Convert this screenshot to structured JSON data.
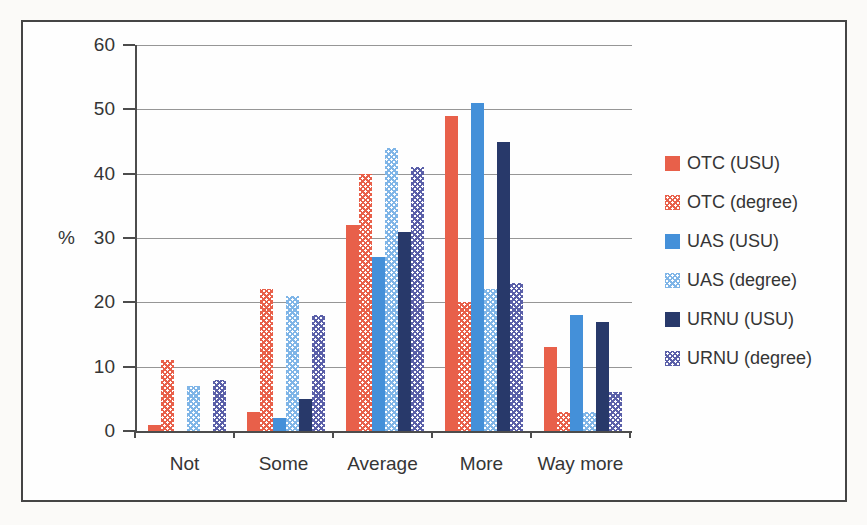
{
  "chart_data": {
    "type": "bar",
    "title": "",
    "categories": [
      "Not",
      "Some",
      "Average",
      "More",
      "Way more"
    ],
    "series": [
      {
        "name": "OTC (USU)",
        "fill": "solid",
        "color": "#E8604A",
        "values": [
          1,
          3,
          32,
          49,
          13
        ]
      },
      {
        "name": "OTC (degree)",
        "fill": "checker",
        "color": "#E8604A",
        "values": [
          11,
          22,
          40,
          20,
          3
        ]
      },
      {
        "name": "UAS (USU)",
        "fill": "solid",
        "color": "#4490D9",
        "values": [
          0,
          2,
          27,
          51,
          18
        ]
      },
      {
        "name": "UAS (degree)",
        "fill": "checker",
        "color": "#7FB5E7",
        "values": [
          7,
          21,
          44,
          22,
          3
        ]
      },
      {
        "name": "URNU (USU)",
        "fill": "solid",
        "color": "#28396A",
        "values": [
          0,
          5,
          31,
          45,
          17
        ]
      },
      {
        "name": "URNU (degree)",
        "fill": "checker",
        "color": "#5A5FA8",
        "values": [
          8,
          18,
          41,
          23,
          6
        ]
      }
    ],
    "xlabel": "",
    "ylabel": "%",
    "ylim": [
      0,
      60
    ],
    "ytick_step": 10,
    "yticks": [
      "0",
      "10",
      "20",
      "30",
      "40",
      "50",
      "60"
    ],
    "grid": true,
    "legend_position": "right",
    "colors": {
      "gridline": "#969696",
      "axis": "#4c4c4c",
      "text": "#353535",
      "frame_border": "#454545",
      "background": "#fefefe"
    }
  }
}
